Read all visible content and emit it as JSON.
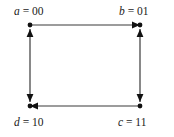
{
  "figure": {
    "type": "directed-graph",
    "background_color": "#ffffff",
    "edge_color": "#3a3a3a",
    "node_color": "#111111",
    "text_color": "#1a1a1a"
  },
  "nodes": [
    {
      "id": "a",
      "var": "a",
      "eq": "=",
      "value": "00",
      "label": "a = 00",
      "x": 30,
      "y": 25,
      "corner": "top-left"
    },
    {
      "id": "b",
      "var": "b",
      "eq": "=",
      "value": "01",
      "label": "b = 01",
      "x": 140,
      "y": 25,
      "corner": "top-right"
    },
    {
      "id": "c",
      "var": "c",
      "eq": "=",
      "value": "11",
      "label": "c = 11",
      "x": 140,
      "y": 106,
      "corner": "bottom-right"
    },
    {
      "id": "d",
      "var": "d",
      "eq": "=",
      "value": "10",
      "label": "d = 10",
      "x": 30,
      "y": 106,
      "corner": "bottom-left"
    }
  ],
  "edges": [
    {
      "from": "a",
      "to": "b",
      "side": "top",
      "direction": "right",
      "arrowheads": "end"
    },
    {
      "from": "c",
      "to": "d",
      "side": "bottom",
      "direction": "left",
      "arrowheads": "end"
    },
    {
      "from": "a",
      "to": "d",
      "side": "left",
      "direction": "both",
      "arrowheads": "both"
    },
    {
      "from": "b",
      "to": "c",
      "side": "right",
      "direction": "both",
      "arrowheads": "both"
    }
  ]
}
